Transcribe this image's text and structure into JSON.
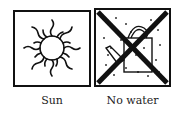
{
  "panels": [
    {
      "label": "Sun",
      "icon": "sun-icon"
    },
    {
      "label": "No water",
      "icon": "watering-can-crossed-icon"
    }
  ]
}
